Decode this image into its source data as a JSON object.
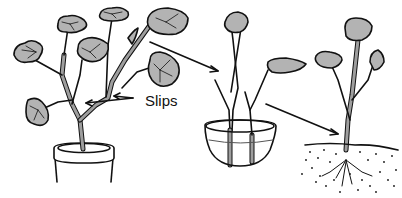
{
  "illustration": {
    "subject": "Propagating plants from slips",
    "label": "Slips",
    "colors": {
      "leaf_fill": "#b3b3b3",
      "stem_fill": "#9e9e9e",
      "outline": "#111111",
      "water_line": "#555555",
      "background": "#ffffff"
    },
    "panels": [
      {
        "name": "parent-plant-in-pot"
      },
      {
        "name": "slips-rooting-in-water-bowl"
      },
      {
        "name": "rooted-slip-planted-in-soil"
      }
    ]
  }
}
